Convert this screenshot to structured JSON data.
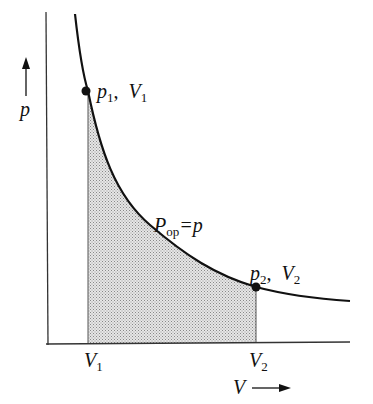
{
  "diagram": {
    "type": "p-V isothermal expansion work diagram",
    "y_axis_label": "p",
    "x_axis_label": "V",
    "point1": {
      "p": "p",
      "p_sub": "1",
      "sep": ",",
      "v": "V",
      "v_sub": "1"
    },
    "point2": {
      "p": "p",
      "p_sub": "2",
      "sep": ",",
      "v": "V",
      "v_sub": "2"
    },
    "x_tick1": {
      "v": "V",
      "sub": "1"
    },
    "x_tick2": {
      "v": "V",
      "sub": "2"
    },
    "curve_label": {
      "main": "P",
      "sub": "op",
      "rhs": "=p"
    },
    "colors": {
      "line": "#111111",
      "fill": "#cfcfcf"
    }
  }
}
